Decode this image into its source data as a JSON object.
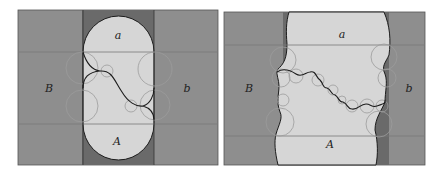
{
  "figure": {
    "panels": [
      {
        "id": "left",
        "labels": {
          "top": "a",
          "bottom": "A",
          "left": "B",
          "right": "b"
        }
      },
      {
        "id": "right",
        "labels": {
          "top": "a",
          "bottom": "A",
          "left": "B",
          "right": "b"
        }
      }
    ],
    "colors": {
      "outer_region": "#8e8e8e",
      "dark_strip": "#6a6a6a",
      "light_region": "#d6d6d6",
      "boundary": "#1c1c1c",
      "circles": "#9c9c9c",
      "grid_lines": "#7a7a7a"
    }
  }
}
